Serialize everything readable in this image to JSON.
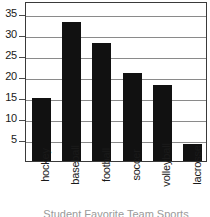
{
  "chart_data": {
    "type": "bar",
    "title": "",
    "xlabel": "Student Favorite Team Sports",
    "ylabel": "",
    "categories": [
      "hockey",
      "baseball",
      "football",
      "soccer",
      "volleyball",
      "lacrosse"
    ],
    "values": [
      15,
      33,
      28,
      21,
      18,
      4
    ],
    "ylim": [
      0,
      38
    ],
    "yticks": [
      5,
      10,
      15,
      20,
      25,
      30,
      35
    ],
    "ytick_labels": [
      "5",
      "10",
      "15",
      "20",
      "25",
      "30",
      "35"
    ],
    "grid": true,
    "grid_axis": "y",
    "legend": false,
    "legend_position": "none",
    "bar_color": "#111111",
    "gridline_color": "#8a8a8a",
    "frame_color": "#3a3a3a"
  }
}
